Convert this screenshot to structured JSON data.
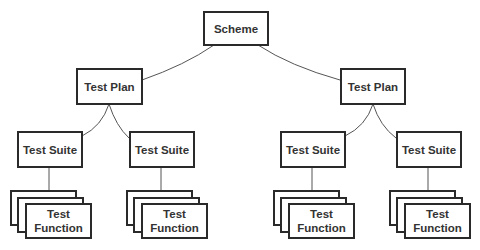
{
  "diagram": {
    "type": "tree",
    "colors": {
      "border": "#2a2a2a",
      "edge": "#555555",
      "text": "#333333",
      "background": "#ffffff"
    },
    "root": {
      "label": "Scheme"
    },
    "plans": [
      {
        "label": "Test Plan"
      },
      {
        "label": "Test Plan"
      }
    ],
    "suites": [
      {
        "label": "Test Suite"
      },
      {
        "label": "Test Suite"
      },
      {
        "label": "Test Suite"
      },
      {
        "label": "Test Suite"
      }
    ],
    "functions": [
      {
        "line1": "Test",
        "line2": "Function"
      },
      {
        "line1": "Test",
        "line2": "Function"
      },
      {
        "line1": "Test",
        "line2": "Function"
      },
      {
        "line1": "Test",
        "line2": "Function"
      }
    ]
  }
}
